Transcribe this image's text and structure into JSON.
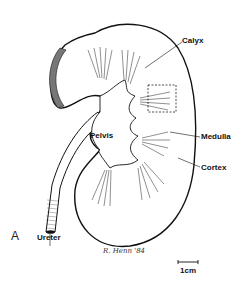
{
  "figure": {
    "panel_letter": "A",
    "labels": {
      "calyx": "Calyx",
      "pelvis": "Pelvis",
      "medulla": "Medulla",
      "cortex": "Cortex",
      "ureter": "Ureter"
    },
    "signature": "R. Henn '84",
    "scale_bar": {
      "label": "1cm"
    },
    "colors": {
      "ink": "#111111",
      "paper": "#ffffff",
      "hatch": "#555555"
    }
  }
}
